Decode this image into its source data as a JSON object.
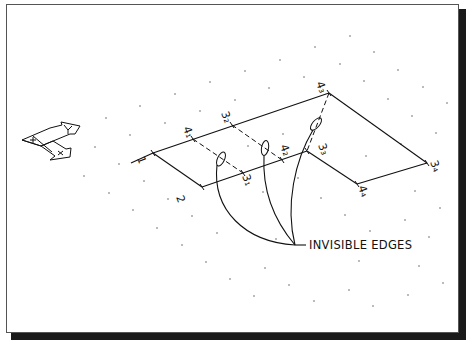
{
  "figure": {
    "type": "isometric-drawing",
    "callout_label": "INVISIBLE EDGES",
    "ucs_icon": {
      "axis_x_label": "X",
      "axis_y_label": "Y",
      "origin_mark": "+"
    },
    "point_labels": {
      "p1": "1",
      "p2": "2",
      "p4_1": "4₁",
      "p3_2": "3₂",
      "p4_3": "4₃",
      "p3_1": "3₁",
      "p4_2": "4₂",
      "p3_3": "3₃",
      "p3_4": "3₄",
      "p4_4": "4₄"
    },
    "colors": {
      "line": "#111111",
      "background": "#ffffff",
      "shadow": "#1a1a1a"
    }
  }
}
